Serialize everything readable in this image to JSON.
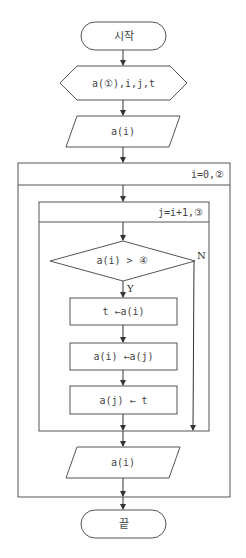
{
  "flowchart": {
    "start": {
      "label": "시작"
    },
    "declare": {
      "label": "a(①),i,j,t"
    },
    "input": {
      "label": "a(i)"
    },
    "outer_loop": {
      "label": "i=0,②"
    },
    "inner_loop": {
      "label": "j=i+1,③"
    },
    "decision": {
      "label": "a(i) > ④",
      "yes_label": "Y",
      "no_label": "N"
    },
    "process": [
      {
        "label": "t ←a(i)"
      },
      {
        "label": "a(i) ←a(j)"
      },
      {
        "label": "a(j) ← t"
      }
    ],
    "output": {
      "label": "a(i)"
    },
    "end": {
      "label": "끝"
    }
  },
  "colors": {
    "stroke": "#555555",
    "text": "#444444",
    "background": "#ffffff"
  }
}
